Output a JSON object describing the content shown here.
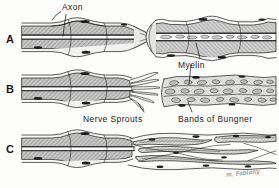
{
  "figure": {
    "background_color": "#fdfdfc",
    "ink_color": "#1a1a1a",
    "myelin_fill": "#b9b9b9",
    "sheath_fill": "#e8e8e6",
    "nucleus_fill": "#222222",
    "debris_fill": "#cfcfcf"
  },
  "panels": [
    {
      "letter": "A",
      "name": "panel-a",
      "caption": ""
    },
    {
      "letter": "B",
      "name": "panel-b",
      "caption": ""
    },
    {
      "letter": "C",
      "name": "panel-c",
      "caption": ""
    }
  ],
  "callouts": [
    {
      "text": "Axon",
      "name": "label-axon"
    },
    {
      "text": "Myelin",
      "name": "label-myelin"
    },
    {
      "text": "Nerve Sprouts",
      "name": "label-nerve-sprouts"
    },
    {
      "text": "Bands of Bungner",
      "name": "label-bands-of-bungner"
    }
  ],
  "signature": "m. Fabiany"
}
